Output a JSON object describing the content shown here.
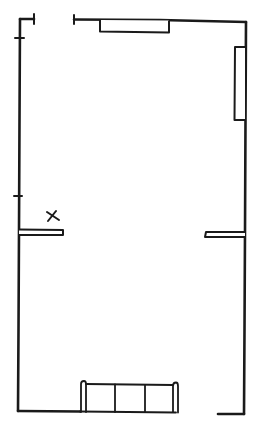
{
  "diagram": {
    "type": "floor-plan-sketch",
    "style": "hand-drawn black ink on white",
    "colors": {
      "ink": "#1a1a1a",
      "background": "#ffffff"
    },
    "marker": {
      "symbol": "X"
    },
    "elements": [
      {
        "kind": "wall",
        "name": "left-wall"
      },
      {
        "kind": "wall",
        "name": "top-wall"
      },
      {
        "kind": "wall",
        "name": "right-wall"
      },
      {
        "kind": "wall",
        "name": "bottom-wall"
      },
      {
        "kind": "window",
        "name": "top-window"
      },
      {
        "kind": "window",
        "name": "right-window"
      },
      {
        "kind": "partition",
        "name": "left-partition-stub"
      },
      {
        "kind": "partition",
        "name": "right-partition-stub"
      },
      {
        "kind": "furniture",
        "name": "bottom-bench",
        "sections": 3
      },
      {
        "kind": "opening",
        "name": "top-left-door-opening"
      },
      {
        "kind": "opening",
        "name": "bottom-right-opening"
      }
    ]
  }
}
